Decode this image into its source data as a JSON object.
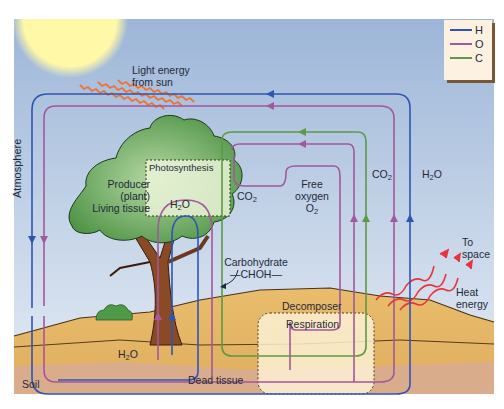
{
  "diagram": {
    "legend": [
      {
        "label": "H",
        "color": "#2f55b3"
      },
      {
        "label": "O",
        "color": "#a3579d"
      },
      {
        "label": "C",
        "color": "#5c9a45"
      }
    ],
    "labels": {
      "light": [
        "Light energy",
        "from sun"
      ],
      "atmosphere": "Atmosphere",
      "producer": [
        "Producer",
        "(plant)",
        "Living tissue"
      ],
      "photosynthesis": "Photosynthesis",
      "co2_leaf": "CO",
      "h2o_tree": "H",
      "free_oxygen": [
        "Free",
        "oxygen",
        "O"
      ],
      "co2_right": "CO",
      "h2o_right": "H",
      "carbohydrate": [
        "Carbohydrate",
        "—CHOH—"
      ],
      "decomposer": "Decomposer",
      "respiration": "Respiration",
      "to_space": [
        "To",
        "space"
      ],
      "heat_energy": [
        "Heat",
        "energy"
      ],
      "h2o_soil": "H",
      "soil": "Soil",
      "dead_tissue": "Dead tissue",
      "sub2": "2",
      "o_suffix": "O"
    },
    "colors": {
      "sky_top": "#9fb8d9",
      "sky_bottom": "#dce6f1",
      "sun": "#fff7a8",
      "sand": "#e3b366",
      "soil": "#d8ae8a",
      "tree_green": "#5d9d52",
      "trunk": "#8a4a26",
      "light_rays": "#ee7332",
      "heat_rays": "#e8343f"
    }
  }
}
